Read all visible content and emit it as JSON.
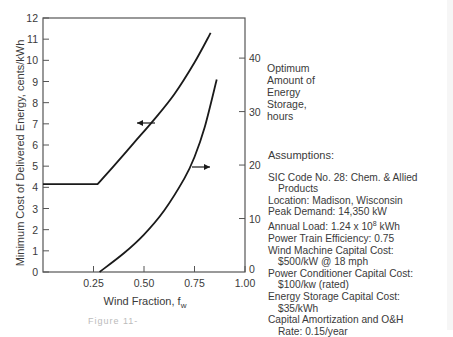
{
  "chart_data": {
    "type": "line",
    "title": "",
    "xlabel": "Wind Fraction, f_w",
    "xlabel_main": "Wind Fraction, f",
    "xlabel_sub": "w",
    "ylabel": "Minimum Cost of Delivered Energy, cents/kWh",
    "ylabel_right": "Optimum Amount of Energy Storage, hours",
    "xlim": [
      0,
      1.0
    ],
    "ylim": [
      0,
      12
    ],
    "ylim_right": [
      0,
      47.5
    ],
    "x_ticks": [
      "0.25",
      "0.50",
      "0.75",
      "1.00"
    ],
    "y_ticks": [
      "0",
      "1",
      "2",
      "3",
      "4",
      "5",
      "6",
      "7",
      "8",
      "9",
      "10",
      "11",
      "12"
    ],
    "y_right_ticks": [
      "0",
      "10",
      "20",
      "30",
      "40"
    ],
    "grid": false,
    "series": [
      {
        "name": "Minimum Cost of Delivered Energy",
        "axis": "left",
        "arrow": "left",
        "x": [
          0.0,
          0.27,
          0.35,
          0.45,
          0.55,
          0.65,
          0.75,
          0.83
        ],
        "y": [
          4.15,
          4.15,
          5.0,
          6.1,
          7.2,
          8.4,
          9.9,
          11.3
        ]
      },
      {
        "name": "Optimum Amount of Energy Storage",
        "axis": "right",
        "arrow": "right",
        "x": [
          0.28,
          0.4,
          0.5,
          0.6,
          0.7,
          0.75,
          0.8,
          0.86
        ],
        "y": [
          0,
          3.5,
          7.0,
          11.5,
          17.5,
          21.5,
          27.0,
          36.0
        ]
      }
    ]
  },
  "right_axis_label_lines": [
    "Optimum",
    "Amount of",
    "Energy",
    "Storage,",
    "hours"
  ],
  "assumptions": {
    "title": "Assumptions:",
    "items": [
      {
        "line1": "SIC Code No. 28: Chem. & Allied",
        "line2": "Products"
      },
      {
        "line1": "Location: Madison, Wisconsin",
        "line2": ""
      },
      {
        "line1": "Peak Demand: 14,350 kW",
        "line2": ""
      },
      {
        "line1": "Annual Load: 1.24 x 10",
        "sup": "8",
        "tail": " kWh",
        "line2": ""
      },
      {
        "line1": "Power Train Efficiency: 0.75",
        "line2": ""
      },
      {
        "line1": "Wind Machine Capital Cost:",
        "line2": "$500/kW @ 18 mph"
      },
      {
        "line1": "Power Conditioner Capital Cost:",
        "line2": "$100/kw (rated)"
      },
      {
        "line1": "Energy Storage Capital Cost:",
        "line2": "$35/kWh"
      },
      {
        "line1": "Capital Amortization and O&H",
        "line2": "Rate: 0.15/year"
      }
    ]
  },
  "caption": "Figure 11-"
}
